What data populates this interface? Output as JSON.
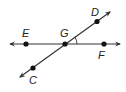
{
  "diagram": {
    "type": "geometry-intersecting-lines",
    "colors": {
      "line": "#333333",
      "point": "#111111",
      "label": "#222222",
      "background": "#ffffff"
    },
    "lines": [
      {
        "name": "line-EF",
        "through": [
          "E",
          "G",
          "F"
        ],
        "arrows": "both"
      },
      {
        "name": "line-CD",
        "through": [
          "C",
          "G",
          "D"
        ],
        "arrows": "both"
      }
    ],
    "points": {
      "E": {
        "label": "E"
      },
      "G": {
        "label": "G"
      },
      "F": {
        "label": "F"
      },
      "D": {
        "label": "D"
      },
      "C": {
        "label": "C"
      }
    },
    "angle_marker": {
      "vertex": "G",
      "between": [
        "F",
        "D"
      ],
      "label": ""
    }
  }
}
